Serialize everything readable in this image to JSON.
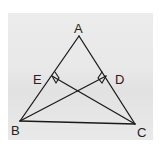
{
  "diagram": {
    "type": "geometry-triangle",
    "note": "Coordinates estimated from the image; BD and CE appear perpendicular to AC and AB based on the right-angle markers",
    "colors": {
      "stroke": "#1a1a1a",
      "label": "#222222",
      "background": "#e8e8e8"
    },
    "vertices": {
      "A": {
        "label": "A",
        "x": 79,
        "y": 36
      },
      "B": {
        "label": "B",
        "x": 20,
        "y": 121
      },
      "C": {
        "label": "C",
        "x": 135,
        "y": 124
      },
      "E": {
        "label": "E",
        "x": 52,
        "y": 76
      },
      "D": {
        "label": "D",
        "x": 106,
        "y": 76
      }
    },
    "segments": [
      {
        "name": "AB",
        "from": "A",
        "to": "B"
      },
      {
        "name": "AC",
        "from": "A",
        "to": "C"
      },
      {
        "name": "BC",
        "from": "B",
        "to": "C"
      },
      {
        "name": "BD",
        "from": "B",
        "to": "D"
      },
      {
        "name": "CE",
        "from": "C",
        "to": "E"
      }
    ],
    "right_angle_markers": [
      {
        "at": "E",
        "between": [
          "AB",
          "CE"
        ]
      },
      {
        "at": "D",
        "between": [
          "AC",
          "BD"
        ]
      }
    ],
    "labels": {
      "A": "A",
      "B": "B",
      "C": "C",
      "D": "D",
      "E": "E"
    }
  }
}
